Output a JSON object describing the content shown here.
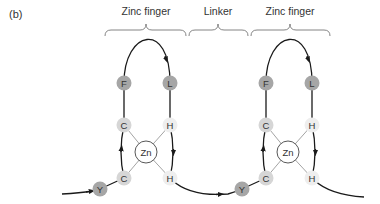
{
  "panel_label": "(b)",
  "segments": [
    {
      "label": "Zinc finger",
      "kind": "zinc-finger"
    },
    {
      "label": "Linker",
      "kind": "linker"
    },
    {
      "label": "Zinc finger",
      "kind": "zinc-finger"
    }
  ],
  "colors": {
    "dark_residue": "#a6a6a6",
    "light_residue": "#d6d6d6",
    "pale_residue": "#eeeeee",
    "zinc_fill": "#ffffff",
    "line": "#1a1a1a",
    "coord_line": "#8c8c8c",
    "text": "#333333"
  },
  "fingers": [
    {
      "residues": [
        {
          "id": "F",
          "label": "F",
          "shade": "dark_residue"
        },
        {
          "id": "L",
          "label": "L",
          "shade": "dark_residue"
        },
        {
          "id": "C1",
          "label": "C",
          "shade": "light_residue"
        },
        {
          "id": "H1",
          "label": "H",
          "shade": "pale_residue"
        },
        {
          "id": "C2",
          "label": "C",
          "shade": "light_residue"
        },
        {
          "id": "H2",
          "label": "H",
          "shade": "pale_residue"
        },
        {
          "id": "Y",
          "label": "Y",
          "shade": "dark_residue"
        }
      ],
      "metal": {
        "label": "Zn"
      }
    },
    {
      "residues": [
        {
          "id": "F",
          "label": "F",
          "shade": "dark_residue"
        },
        {
          "id": "L",
          "label": "L",
          "shade": "dark_residue"
        },
        {
          "id": "C1",
          "label": "C",
          "shade": "light_residue"
        },
        {
          "id": "H1",
          "label": "H",
          "shade": "pale_residue"
        },
        {
          "id": "C2",
          "label": "C",
          "shade": "light_residue"
        },
        {
          "id": "H2",
          "label": "H",
          "shade": "pale_residue"
        },
        {
          "id": "Y",
          "label": "Y",
          "shade": "dark_residue"
        }
      ],
      "metal": {
        "label": "Zn"
      }
    }
  ],
  "coordination": [
    "C1",
    "H1",
    "C2",
    "H2"
  ]
}
